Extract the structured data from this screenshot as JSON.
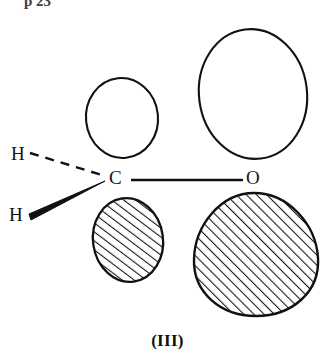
{
  "figure": {
    "caption": "(III)",
    "page_header": "p 23",
    "background_color": "#ffffff",
    "ink_color": "#111111"
  },
  "atoms": [
    {
      "id": "h-dashed",
      "label": "H",
      "x": 11,
      "y": 144
    },
    {
      "id": "h-wedge",
      "label": "H",
      "x": 9,
      "y": 205
    },
    {
      "id": "carbon",
      "label": "C",
      "x": 109,
      "y": 168
    },
    {
      "id": "oxygen",
      "label": "O",
      "x": 246,
      "y": 168
    }
  ],
  "bonds": [
    {
      "id": "c-o-bond",
      "from": "carbon",
      "to": "oxygen",
      "style": "plain-line"
    },
    {
      "id": "c-h-dashed",
      "from": "carbon",
      "to": "h-dashed",
      "style": "dashed-wedge"
    },
    {
      "id": "c-h-wedge",
      "from": "carbon",
      "to": "h-wedge",
      "style": "solid-wedge"
    }
  ],
  "orbital_lobes": [
    {
      "id": "carbon-upper-lobe",
      "atom": "carbon",
      "phase": "unshaded",
      "position": "above",
      "fill": "white"
    },
    {
      "id": "carbon-lower-lobe",
      "atom": "carbon",
      "phase": "hatched",
      "position": "below",
      "fill": "diagonal-hatch"
    },
    {
      "id": "oxygen-upper-lobe",
      "atom": "oxygen",
      "phase": "unshaded",
      "position": "above",
      "fill": "white"
    },
    {
      "id": "oxygen-lower-lobe",
      "atom": "oxygen",
      "phase": "hatched",
      "position": "below",
      "fill": "diagonal-hatch"
    }
  ]
}
